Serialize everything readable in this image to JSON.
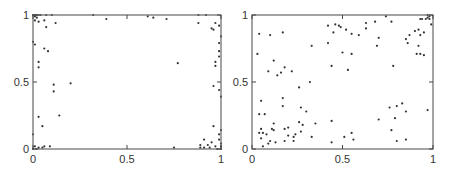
{
  "chart_data": [
    {
      "type": "scatter",
      "title": "",
      "xlabel": "",
      "ylabel": "",
      "xlim": [
        0,
        1
      ],
      "ylim": [
        0,
        1
      ],
      "grid": false,
      "xticks": [
        "0",
        "0.5",
        "1"
      ],
      "yticks": [
        "0",
        "0.5",
        "1"
      ],
      "frame": {
        "x0": 33,
        "y0": 15,
        "x1": 221,
        "y1": 149
      },
      "marker_color": "#333333",
      "points": [
        [
          0.0,
          1.0
        ],
        [
          0.01,
          1.0
        ],
        [
          0.02,
          1.0
        ],
        [
          0.03,
          1.0
        ],
        [
          0.04,
          1.0
        ],
        [
          0.07,
          1.0
        ],
        [
          0.1,
          1.0
        ],
        [
          0.01,
          0.99
        ],
        [
          0.02,
          0.98
        ],
        [
          0.01,
          0.96
        ],
        [
          0.03,
          0.95
        ],
        [
          0.06,
          0.96
        ],
        [
          0.12,
          0.94
        ],
        [
          0.07,
          0.91
        ],
        [
          0.0,
          0.8
        ],
        [
          0.01,
          0.78
        ],
        [
          0.06,
          0.75
        ],
        [
          0.08,
          0.73
        ],
        [
          0.03,
          0.65
        ],
        [
          0.03,
          0.61
        ],
        [
          0.11,
          0.48
        ],
        [
          0.2,
          0.49
        ],
        [
          0.11,
          0.43
        ],
        [
          0.03,
          0.24
        ],
        [
          0.14,
          0.25
        ],
        [
          0.05,
          0.17
        ],
        [
          0.0,
          0.11
        ],
        [
          0.01,
          0.02
        ],
        [
          0.03,
          0.01
        ],
        [
          0.05,
          0.01
        ],
        [
          0.06,
          0.02
        ],
        [
          0.09,
          0.02
        ],
        [
          0.02,
          0.0
        ],
        [
          0.0,
          0.0
        ],
        [
          0.32,
          1.0
        ],
        [
          0.39,
          0.97
        ],
        [
          0.61,
          0.99
        ],
        [
          0.64,
          0.98
        ],
        [
          0.71,
          0.97
        ],
        [
          0.77,
          0.64
        ],
        [
          0.75,
          0.01
        ],
        [
          0.88,
          1.0
        ],
        [
          0.92,
          1.0
        ],
        [
          0.88,
          0.94
        ],
        [
          0.97,
          0.94
        ],
        [
          0.99,
          0.92
        ],
        [
          0.95,
          0.9
        ],
        [
          0.96,
          0.89
        ],
        [
          1.0,
          0.84
        ],
        [
          0.99,
          0.79
        ],
        [
          0.99,
          0.73
        ],
        [
          0.99,
          0.69
        ],
        [
          0.97,
          0.65
        ],
        [
          0.97,
          0.62
        ],
        [
          0.96,
          0.47
        ],
        [
          0.99,
          0.44
        ],
        [
          1.0,
          0.39
        ],
        [
          0.96,
          0.17
        ],
        [
          1.0,
          0.14
        ],
        [
          0.99,
          0.11
        ],
        [
          0.91,
          0.07
        ],
        [
          0.99,
          0.07
        ],
        [
          0.95,
          0.05
        ],
        [
          1.0,
          0.04
        ],
        [
          0.89,
          0.03
        ],
        [
          0.93,
          0.03
        ],
        [
          0.97,
          0.02
        ],
        [
          0.89,
          0.01
        ],
        [
          0.91,
          0.01
        ],
        [
          0.94,
          0.01
        ],
        [
          0.98,
          0.0
        ],
        [
          1.0,
          0.0
        ],
        [
          1.0,
          0.02
        ]
      ]
    },
    {
      "type": "scatter",
      "title": "",
      "xlabel": "",
      "ylabel": "",
      "xlim": [
        0,
        1
      ],
      "ylim": [
        0,
        1
      ],
      "grid": false,
      "xticks": [
        "0",
        "0.5",
        "1"
      ],
      "yticks": [
        "0",
        "0.5",
        "1"
      ],
      "frame": {
        "x0": 252,
        "y0": 15,
        "x1": 433,
        "y1": 149
      },
      "marker_color": "#333333",
      "points": [
        [
          0.03,
          0.71
        ],
        [
          0.04,
          0.86
        ],
        [
          0.1,
          0.85
        ],
        [
          0.17,
          0.87
        ],
        [
          0.33,
          0.77
        ],
        [
          0.42,
          0.79
        ],
        [
          0.42,
          0.92
        ],
        [
          0.45,
          0.87
        ],
        [
          0.46,
          0.93
        ],
        [
          0.48,
          0.92
        ],
        [
          0.49,
          0.91
        ],
        [
          0.52,
          0.89
        ],
        [
          0.55,
          0.86
        ],
        [
          0.59,
          0.85
        ],
        [
          0.63,
          0.9
        ],
        [
          0.63,
          0.94
        ],
        [
          0.68,
          0.95
        ],
        [
          0.74,
          0.99
        ],
        [
          0.77,
          0.95
        ],
        [
          0.69,
          0.77
        ],
        [
          0.7,
          0.83
        ],
        [
          0.5,
          0.72
        ],
        [
          0.55,
          0.71
        ],
        [
          0.44,
          0.62
        ],
        [
          0.53,
          0.59
        ],
        [
          0.12,
          0.66
        ],
        [
          0.09,
          0.58
        ],
        [
          0.14,
          0.55
        ],
        [
          0.16,
          0.57
        ],
        [
          0.18,
          0.61
        ],
        [
          0.22,
          0.58
        ],
        [
          0.32,
          0.5
        ],
        [
          0.26,
          0.46
        ],
        [
          0.17,
          0.38
        ],
        [
          0.05,
          0.36
        ],
        [
          0.17,
          0.32
        ],
        [
          0.27,
          0.31
        ],
        [
          0.3,
          0.28
        ],
        [
          0.04,
          0.26
        ],
        [
          0.07,
          0.26
        ],
        [
          0.12,
          0.19
        ],
        [
          0.26,
          0.2
        ],
        [
          0.28,
          0.18
        ],
        [
          0.35,
          0.19
        ],
        [
          0.44,
          0.21
        ],
        [
          0.05,
          0.15
        ],
        [
          0.04,
          0.12
        ],
        [
          0.06,
          0.12
        ],
        [
          0.08,
          0.11
        ],
        [
          0.11,
          0.15
        ],
        [
          0.12,
          0.14
        ],
        [
          0.18,
          0.15
        ],
        [
          0.2,
          0.16
        ],
        [
          0.24,
          0.11
        ],
        [
          0.27,
          0.13
        ],
        [
          0.2,
          0.1
        ],
        [
          0.23,
          0.09
        ],
        [
          0.33,
          0.09
        ],
        [
          0.1,
          0.06
        ],
        [
          0.05,
          0.08
        ],
        [
          0.09,
          0.04
        ],
        [
          0.13,
          0.05
        ],
        [
          0.18,
          0.06
        ],
        [
          0.23,
          0.06
        ],
        [
          0.06,
          0.02
        ],
        [
          0.44,
          0.05
        ],
        [
          0.51,
          0.09
        ],
        [
          0.55,
          0.12
        ],
        [
          0.56,
          0.07
        ],
        [
          0.7,
          0.22
        ],
        [
          0.76,
          0.31
        ],
        [
          0.79,
          0.23
        ],
        [
          0.8,
          0.32
        ],
        [
          0.83,
          0.34
        ],
        [
          0.85,
          0.28
        ],
        [
          0.77,
          0.14
        ],
        [
          0.8,
          0.06
        ],
        [
          0.85,
          0.07
        ],
        [
          0.97,
          0.29
        ],
        [
          0.78,
          0.62
        ],
        [
          0.85,
          0.82
        ],
        [
          0.86,
          0.79
        ],
        [
          0.87,
          0.85
        ],
        [
          0.9,
          0.88
        ],
        [
          0.92,
          0.89
        ],
        [
          0.93,
          0.85
        ],
        [
          0.95,
          0.87
        ],
        [
          0.92,
          0.77
        ],
        [
          0.91,
          0.71
        ],
        [
          0.93,
          0.71
        ],
        [
          0.95,
          0.7
        ],
        [
          0.93,
          0.97
        ],
        [
          0.94,
          0.97
        ],
        [
          0.96,
          0.97
        ],
        [
          0.97,
          0.98
        ],
        [
          0.98,
          0.99
        ],
        [
          0.98,
          0.97
        ],
        [
          0.99,
          0.93
        ],
        [
          0.97,
          1.0
        ]
      ]
    }
  ]
}
